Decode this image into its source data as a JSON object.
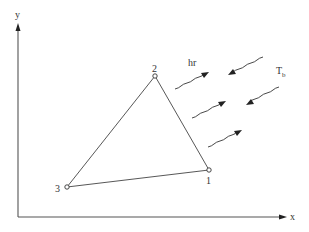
{
  "axes": {
    "x_label": "x",
    "y_label": "y"
  },
  "nodes": [
    {
      "id": "1",
      "label": "1"
    },
    {
      "id": "2",
      "label": "2"
    },
    {
      "id": "3",
      "label": "3"
    }
  ],
  "edges": [
    {
      "from": "1",
      "to": "2"
    },
    {
      "from": "2",
      "to": "3"
    },
    {
      "from": "3",
      "to": "1"
    }
  ],
  "annotations": {
    "radiation_coefficient": "hr",
    "boundary_temperature_main": "T",
    "boundary_temperature_sub": "b"
  },
  "radiation_arrows": [
    {
      "direction": "outgoing"
    },
    {
      "direction": "incoming"
    },
    {
      "direction": "outgoing"
    },
    {
      "direction": "incoming"
    },
    {
      "direction": "outgoing"
    }
  ],
  "colors": {
    "line": "#444444",
    "text": "#333333",
    "background": "#ffffff"
  }
}
